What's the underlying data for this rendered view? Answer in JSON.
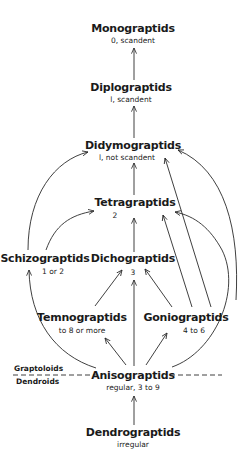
{
  "diagram": {
    "type": "phylogeny-flow",
    "nodes": {
      "monograptids": {
        "label": "Monograptids",
        "sub": "0, scandent"
      },
      "diplograptids": {
        "label": "Diplograptids",
        "sub": "l, scandent"
      },
      "didymograptids": {
        "label": "Didymograptids",
        "sub": "l, not scandent"
      },
      "tetragraptids": {
        "label": "Tetragraptids",
        "sub": "2"
      },
      "schizograptids": {
        "label": "Schizograptids",
        "sub": "1 or 2"
      },
      "dichograptids": {
        "label": "Dichograptids",
        "sub": "3"
      },
      "temnograptids": {
        "label": "Temnograptids",
        "sub": "to 8 or more"
      },
      "goniograptids": {
        "label": "Goniograptids",
        "sub": "4 to 6"
      },
      "anisograptids": {
        "label": "Anisograptids",
        "sub": "regular, 3 to 9"
      },
      "dendrograptids": {
        "label": "Dendrograptids",
        "sub": "irregular"
      }
    },
    "divider": {
      "above": "Graptoloids",
      "below": "Dendroids"
    },
    "edges": [
      [
        "dendrograptids",
        "anisograptids"
      ],
      [
        "anisograptids",
        "schizograptids"
      ],
      [
        "anisograptids",
        "temnograptids"
      ],
      [
        "anisograptids",
        "dichograptids"
      ],
      [
        "anisograptids",
        "goniograptids"
      ],
      [
        "anisograptids",
        "tetragraptids"
      ],
      [
        "anisograptids",
        "didymograptids"
      ],
      [
        "temnograptids",
        "dichograptids"
      ],
      [
        "goniograptids",
        "dichograptids"
      ],
      [
        "goniograptids",
        "tetragraptids"
      ],
      [
        "goniograptids",
        "didymograptids"
      ],
      [
        "schizograptids",
        "tetragraptids"
      ],
      [
        "schizograptids",
        "didymograptids"
      ],
      [
        "dichograptids",
        "tetragraptids"
      ],
      [
        "tetragraptids",
        "didymograptids"
      ],
      [
        "didymograptids",
        "diplograptids"
      ],
      [
        "diplograptids",
        "monograptids"
      ]
    ],
    "colors": {
      "ink": "#1a1a1a",
      "background": "#ffffff"
    }
  }
}
